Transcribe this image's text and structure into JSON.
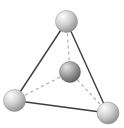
{
  "figure": {
    "width": 124,
    "height": 128,
    "background_color": "#ffffff"
  },
  "chart_data": {
    "type": "scatter",
    "xlabel": "",
    "ylabel": "",
    "xlim": [
      0,
      124
    ],
    "ylim": [
      0,
      128
    ],
    "grid": false,
    "legend": "none",
    "nodes": [
      {
        "id": "apex",
        "label": "top sphere",
        "x": 66.5,
        "y": 21.5,
        "r": 11,
        "shade": "light",
        "fill_light": "#f2f2f2",
        "fill_mid": "#c4c4c4",
        "fill_dark": "#8e8e8e"
      },
      {
        "id": "base-left",
        "label": "bottom-left sphere",
        "x": 14.5,
        "y": 100.5,
        "r": 11,
        "shade": "light",
        "fill_light": "#f2f2f2",
        "fill_mid": "#c4c4c4",
        "fill_dark": "#8e8e8e"
      },
      {
        "id": "base-right",
        "label": "bottom-right sphere",
        "x": 108,
        "y": 113,
        "r": 11,
        "shade": "light",
        "fill_light": "#f2f2f2",
        "fill_mid": "#c4c4c4",
        "fill_dark": "#8e8e8e"
      },
      {
        "id": "center",
        "label": "center sphere",
        "x": 70,
        "y": 72,
        "r": 10.5,
        "shade": "dark",
        "fill_light": "#d8d8d8",
        "fill_mid": "#9a9a9a",
        "fill_dark": "#5f5f5f"
      }
    ],
    "edges": [
      {
        "id": "apex-to-base-left",
        "from": "apex",
        "to": "base-left",
        "style": "solid",
        "color": "#3c3c3c",
        "width": 1.4
      },
      {
        "id": "apex-to-base-right",
        "from": "apex",
        "to": "base-right",
        "style": "solid",
        "color": "#3c3c3c",
        "width": 1.4
      },
      {
        "id": "base-left-to-base-right",
        "from": "base-left",
        "to": "base-right",
        "style": "solid",
        "color": "#3c3c3c",
        "width": 1.4
      },
      {
        "id": "apex-to-center",
        "from": "apex",
        "to": "center",
        "style": "dashed",
        "color": "#a8a8a8",
        "width": 1.1,
        "dash": "3 3"
      },
      {
        "id": "base-left-to-center",
        "from": "base-left",
        "to": "center",
        "style": "dashed",
        "color": "#a8a8a8",
        "width": 1.1,
        "dash": "3 3"
      },
      {
        "id": "base-right-to-center",
        "from": "base-right",
        "to": "center",
        "style": "dashed",
        "color": "#a8a8a8",
        "width": 1.1,
        "dash": "3 3"
      }
    ]
  }
}
